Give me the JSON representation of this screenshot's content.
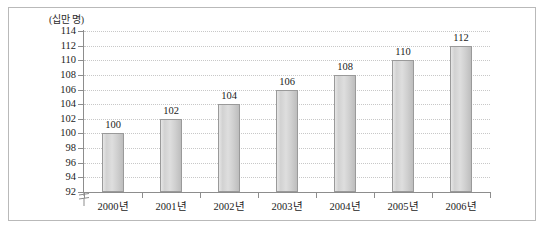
{
  "figure": {
    "unit_label": "(십만 명)",
    "background": "#ffffff",
    "frame_color": "#b9b9b9"
  },
  "chart_data": {
    "type": "bar",
    "title": "",
    "subtitle": "",
    "xlabel": "",
    "ylabel": "(십만 명)",
    "categories": [
      "2000년",
      "2001년",
      "2002년",
      "2003년",
      "2004년",
      "2005년",
      "2006년"
    ],
    "values": [
      100,
      102,
      104,
      106,
      108,
      110,
      112
    ],
    "data_labels": [
      "100",
      "102",
      "104",
      "106",
      "108",
      "110",
      "112"
    ],
    "ylim": [
      92,
      114
    ],
    "ytick_step": 2,
    "yticks": [
      114,
      112,
      110,
      108,
      106,
      104,
      102,
      100,
      98,
      96,
      94,
      92
    ],
    "ytick_labels": [
      "114",
      "112",
      "110",
      "108",
      "106",
      "104",
      "102",
      "100",
      "98",
      "96",
      "94",
      "92"
    ],
    "axis_break": true,
    "grid": true,
    "grid_style": "dotted",
    "grid_color": "#c8c8c8",
    "legend": false,
    "legend_position": "none",
    "bar_fill": "#d6d6d6",
    "bar_border": "#9a9a9a",
    "axis_color": "#8d8d8d",
    "text_color": "#1c1c1c"
  }
}
